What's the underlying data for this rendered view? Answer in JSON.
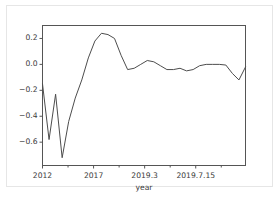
{
  "chart_data": {
    "type": "line",
    "title": "",
    "xlabel": "year",
    "ylabel": "",
    "grid": false,
    "legend": null,
    "xlim": [
      0,
      31
    ],
    "ylim": [
      -0.78,
      0.3
    ],
    "xtick_positions": [
      0,
      7.8,
      15.6,
      23.4
    ],
    "xtick_labels": [
      "2012",
      "2017",
      "2019.3",
      "2019.7.15"
    ],
    "ytick_values": [
      0.2,
      0.0,
      -0.2,
      -0.4,
      -0.6
    ],
    "ytick_labels": [
      "0.2",
      "0.0",
      "−0.2",
      "−0.4",
      "−0.6"
    ],
    "line_color": "#4d4d4d",
    "line_width": 1,
    "x": [
      0,
      1,
      2,
      3,
      4,
      5,
      6,
      7,
      8,
      9,
      10,
      11,
      12,
      13,
      14,
      15,
      16,
      17,
      18,
      19,
      20,
      21,
      22,
      23,
      24,
      25,
      26,
      27,
      28,
      29,
      30,
      31
    ],
    "values": [
      -0.15,
      -0.58,
      -0.23,
      -0.72,
      -0.44,
      -0.26,
      -0.12,
      0.05,
      0.18,
      0.24,
      0.23,
      0.2,
      0.07,
      -0.04,
      -0.03,
      0.0,
      0.03,
      0.02,
      -0.01,
      -0.04,
      -0.04,
      -0.03,
      -0.05,
      -0.04,
      -0.01,
      0.0,
      0.0,
      0.0,
      -0.005,
      -0.07,
      -0.12,
      -0.02
    ],
    "series": [
      {
        "name": "series-1",
        "values": [
          -0.15,
          -0.58,
          -0.23,
          -0.72,
          -0.44,
          -0.26,
          -0.12,
          0.05,
          0.18,
          0.24,
          0.23,
          0.2,
          0.07,
          -0.04,
          -0.03,
          0.0,
          0.03,
          0.02,
          -0.01,
          -0.04,
          -0.04,
          -0.03,
          -0.05,
          -0.04,
          -0.01,
          0.0,
          0.0,
          0.0,
          -0.005,
          -0.07,
          -0.12,
          -0.02
        ]
      }
    ]
  }
}
